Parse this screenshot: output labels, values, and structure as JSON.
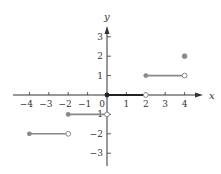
{
  "chart_data": {
    "type": "line",
    "title": "",
    "xlabel": "x",
    "ylabel": "y",
    "xlim": [
      -4.5,
      5
    ],
    "ylim": [
      -3.5,
      3.7
    ],
    "grid": false,
    "x_ticks": [
      -4,
      -3,
      -2,
      -1,
      0,
      1,
      2,
      3,
      4
    ],
    "x_tick_labels": [
      "−4",
      "−3",
      "−2",
      "−1",
      "0",
      "1",
      "2",
      "3",
      "4"
    ],
    "y_ticks": [
      -3,
      -2,
      -1,
      1,
      2,
      3
    ],
    "y_tick_labels": [
      "−3",
      "−2",
      "−1",
      "1",
      "2",
      "3"
    ],
    "segments": [
      {
        "x_start": -4,
        "x_end": -2,
        "y": -2,
        "start_closed": true,
        "end_closed": false
      },
      {
        "x_start": -2,
        "x_end": 0,
        "y": -1,
        "start_closed": true,
        "end_closed": false
      },
      {
        "x_start": 0,
        "x_end": 2,
        "y": 0,
        "start_closed": true,
        "end_closed": false
      },
      {
        "x_start": 2,
        "x_end": 4,
        "y": 1,
        "start_closed": true,
        "end_closed": false
      }
    ],
    "isolated_points": [
      {
        "x": 4,
        "y": 2,
        "closed": true
      }
    ],
    "colors": {
      "axis": "#333333",
      "segment": "#888888",
      "point_fill": "#888888"
    }
  }
}
